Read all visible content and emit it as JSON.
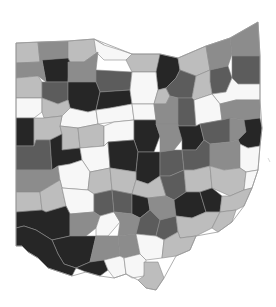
{
  "map": {
    "title": "",
    "region": "Ohio counties",
    "legend": [],
    "shade_palette": {
      "white": "#f7f7f7",
      "light": "#bdbdbd",
      "medium": "#8c8c8c",
      "dark": "#5c5c5c",
      "black": "#262626"
    },
    "counties": [
      {
        "id": "c01",
        "shade": "light",
        "points": "16,43 38,42 40,62 16,63"
      },
      {
        "id": "c02",
        "shade": "medium",
        "points": "38,42 68,41 68,58 42,60 40,62"
      },
      {
        "id": "c03",
        "shade": "light",
        "points": "68,41 94,39 104,45 98,52 84,62 70,62 68,58"
      },
      {
        "id": "c04",
        "shade": "white",
        "points": "94,39 104,45 120,50 132,54 138,58 126,60 104,60 96,52"
      },
      {
        "id": "c05",
        "shade": "light",
        "points": "132,54 160,54 160,72 132,72 126,60"
      },
      {
        "id": "c06",
        "shade": "black",
        "points": "160,54 178,58 180,70 176,78 166,88 158,90 156,72"
      },
      {
        "id": "c07",
        "shade": "light",
        "points": "178,58 206,46 210,70 196,76 180,70"
      },
      {
        "id": "c08",
        "shade": "medium",
        "points": "206,46 230,38 232,54 228,66 210,70"
      },
      {
        "id": "c09",
        "shade": "medium",
        "points": "230,38 258,22 260,56 232,56 232,54"
      },
      {
        "id": "c10",
        "shade": "dark",
        "points": "232,56 260,56 260,84 238,84 232,78"
      },
      {
        "id": "c11",
        "shade": "dark",
        "points": "210,70 228,66 232,78 226,92 212,94 210,82"
      },
      {
        "id": "c12",
        "shade": "black",
        "points": "42,60 68,58 70,62 68,82 46,82"
      },
      {
        "id": "c13",
        "shade": "medium",
        "points": "16,63 40,62 42,60 46,82 38,76 16,78"
      },
      {
        "id": "c14",
        "shade": "medium",
        "points": "68,62 84,62 98,52 96,70 96,82 70,82 68,82"
      },
      {
        "id": "c15",
        "shade": "dark",
        "points": "96,70 132,72 130,90 100,92 96,82"
      },
      {
        "id": "c16",
        "shade": "light",
        "points": "16,78 38,76 42,82 42,98 16,98"
      },
      {
        "id": "c17",
        "shade": "dark",
        "points": "42,82 68,82 68,100 58,104 42,98"
      },
      {
        "id": "c18",
        "shade": "black",
        "points": "68,82 96,82 100,92 96,110 88,112 70,108 68,100"
      },
      {
        "id": "c19",
        "shade": "black",
        "points": "100,92 130,90 132,104 110,108 96,110"
      },
      {
        "id": "c20",
        "shade": "white",
        "points": "132,72 156,72 158,90 154,104 132,104 130,90"
      },
      {
        "id": "c21",
        "shade": "light",
        "points": "158,90 166,88 170,96 166,104 154,104"
      },
      {
        "id": "c22",
        "shade": "dark",
        "points": "166,88 176,78 180,70 196,76 192,98 178,98 170,96"
      },
      {
        "id": "c23",
        "shade": "light",
        "points": "196,76 210,70 210,82 212,94 194,100 192,98"
      },
      {
        "id": "c24",
        "shade": "white",
        "points": "212,94 226,92 232,78 238,84 260,84 260,100 236,100 220,104"
      },
      {
        "id": "c25",
        "shade": "white",
        "points": "16,98 42,98 42,112 34,118 16,118"
      },
      {
        "id": "c26",
        "shade": "light",
        "points": "42,98 58,104 68,100 70,108 62,116 44,118 42,112"
      },
      {
        "id": "c27",
        "shade": "white",
        "points": "70,108 88,112 96,110 98,124 78,128 60,126 62,116"
      },
      {
        "id": "c28",
        "shade": "white",
        "points": "96,110 110,108 132,104 134,120 114,122 98,124"
      },
      {
        "id": "c29",
        "shade": "white",
        "points": "132,104 154,104 156,120 134,120"
      },
      {
        "id": "c30",
        "shade": "medium",
        "points": "154,104 166,104 170,96 178,98 178,124 156,124 156,120"
      },
      {
        "id": "c31",
        "shade": "dark",
        "points": "178,98 192,98 194,100 196,126 178,126 178,124"
      },
      {
        "id": "c32",
        "shade": "white",
        "points": "194,100 212,94 220,104 222,120 200,124 196,126"
      },
      {
        "id": "c33",
        "shade": "medium",
        "points": "220,104 236,100 260,100 260,118 244,120 230,118 222,120"
      },
      {
        "id": "c34",
        "shade": "black",
        "points": "16,118 34,118 34,146 16,146"
      },
      {
        "id": "c35",
        "shade": "light",
        "points": "34,118 44,118 62,116 60,126 62,134 50,140 36,140 34,146 34,118"
      },
      {
        "id": "c36",
        "shade": "light",
        "points": "60,126 78,128 80,148 62,150 62,134"
      },
      {
        "id": "c37",
        "shade": "light",
        "points": "78,128 98,124 104,126 104,146 80,148"
      },
      {
        "id": "c38",
        "shade": "white",
        "points": "104,126 114,122 134,120 134,140 108,142 104,146"
      },
      {
        "id": "c39",
        "shade": "black",
        "points": "134,120 156,120 156,124 160,136 154,152 138,152 134,140"
      },
      {
        "id": "c40",
        "shade": "medium",
        "points": "156,124 178,124 178,126 182,140 174,150 160,152 160,136"
      },
      {
        "id": "c41",
        "shade": "black",
        "points": "178,126 196,126 200,124 204,140 196,150 182,150 182,140"
      },
      {
        "id": "c42",
        "shade": "dark",
        "points": "200,124 222,120 230,118 230,142 210,144 204,140"
      },
      {
        "id": "c43",
        "shade": "medium",
        "points": "230,118 244,120 246,132 238,140 230,142"
      },
      {
        "id": "c44",
        "shade": "black",
        "points": "244,120 260,118 262,128 260,146 248,148 240,144 238,140 246,132"
      },
      {
        "id": "c45",
        "shade": "dark",
        "points": "16,146 34,146 36,140 50,140 52,170 16,170"
      },
      {
        "id": "c46",
        "shade": "black",
        "points": "50,140 62,134 62,150 80,148 82,160 70,164 58,166 52,170"
      },
      {
        "id": "c47",
        "shade": "white",
        "points": "80,148 104,146 108,142 110,168 90,172 82,160"
      },
      {
        "id": "c48",
        "shade": "black",
        "points": "108,142 134,140 138,152 136,172 110,168"
      },
      {
        "id": "c49",
        "shade": "black",
        "points": "138,152 154,152 160,152 160,176 148,184 136,180 136,172"
      },
      {
        "id": "c50",
        "shade": "dark",
        "points": "160,152 174,150 182,150 184,170 170,176 160,176"
      },
      {
        "id": "c51",
        "shade": "dark",
        "points": "182,150 196,150 204,140 210,144 210,166 194,170 184,170"
      },
      {
        "id": "c52",
        "shade": "medium",
        "points": "210,144 230,142 238,140 240,144 240,168 224,170 210,166"
      },
      {
        "id": "c53",
        "shade": "white",
        "points": "240,144 248,148 260,146 258,170 246,172 240,168"
      },
      {
        "id": "c54",
        "shade": "medium",
        "points": "16,170 52,170 58,166 60,180 40,192 16,192"
      },
      {
        "id": "c55",
        "shade": "white",
        "points": "58,166 70,164 82,160 90,172 88,190 62,188 60,180"
      },
      {
        "id": "c56",
        "shade": "light",
        "points": "90,172 110,168 112,190 94,194 88,190"
      },
      {
        "id": "c57",
        "shade": "light",
        "points": "110,168 136,172 136,180 132,194 112,190"
      },
      {
        "id": "c58",
        "shade": "light",
        "points": "136,180 148,184 160,176 166,196 148,198 132,194"
      },
      {
        "id": "c59",
        "shade": "dark",
        "points": "160,176 170,176 184,170 186,192 174,200 166,196"
      },
      {
        "id": "c60",
        "shade": "light",
        "points": "184,170 194,170 210,166 212,188 200,192 186,192"
      },
      {
        "id": "c61",
        "shade": "light",
        "points": "210,166 224,170 240,168 246,172 244,190 230,196 212,188"
      },
      {
        "id": "c62",
        "shade": "white",
        "points": "246,172 258,170 252,188 244,190"
      },
      {
        "id": "c63",
        "shade": "light",
        "points": "16,192 40,192 42,210 16,212"
      },
      {
        "id": "c64",
        "shade": "light",
        "points": "40,192 60,180 62,188 66,206 46,212 42,210"
      },
      {
        "id": "c65",
        "shade": "white",
        "points": "62,188 88,190 94,194 94,212 70,214 66,206"
      },
      {
        "id": "c66",
        "shade": "dark",
        "points": "94,194 112,190 114,212 100,216 94,212"
      },
      {
        "id": "c67",
        "shade": "dark",
        "points": "112,190 132,194 132,214 114,212"
      },
      {
        "id": "c68",
        "shade": "black",
        "points": "132,194 148,198 150,210 140,218 132,214"
      },
      {
        "id": "c69",
        "shade": "medium",
        "points": "148,198 166,196 174,200 176,216 160,220 150,210"
      },
      {
        "id": "c70",
        "shade": "black",
        "points": "174,200 186,192 200,192 206,212 192,218 176,216"
      },
      {
        "id": "c71",
        "shade": "black",
        "points": "200,192 212,188 222,196 220,212 206,212"
      },
      {
        "id": "c72",
        "shade": "light",
        "points": "222,196 230,196 244,190 252,188 244,206 236,210 220,212"
      },
      {
        "id": "c73",
        "shade": "black",
        "points": "16,212 42,210 46,212 66,206 70,214 70,236 52,240 36,230 24,226 16,228"
      },
      {
        "id": "c74",
        "shade": "medium",
        "points": "70,214 94,212 100,216 96,228 86,236 70,236"
      },
      {
        "id": "c75",
        "shade": "white",
        "points": "100,216 114,212 120,222 108,236 96,236 96,228"
      },
      {
        "id": "c76",
        "shade": "medium",
        "points": "114,212 132,214 140,218 136,234 118,236 120,222"
      },
      {
        "id": "c77",
        "shade": "dark",
        "points": "140,218 150,210 160,220 156,236 136,234"
      },
      {
        "id": "c78",
        "shade": "dark",
        "points": "160,220 176,216 178,232 164,240 156,236"
      },
      {
        "id": "c79",
        "shade": "light",
        "points": "176,216 192,218 206,212 220,212 212,228 196,236 180,238 178,232"
      },
      {
        "id": "c80",
        "shade": "light",
        "points": "220,212 236,210 232,222 218,232 212,228"
      },
      {
        "id": "c81",
        "shade": "black",
        "points": "52,240 70,236 86,236 96,236 90,262 76,268 64,264 58,254"
      },
      {
        "id": "c82",
        "shade": "medium",
        "points": "96,236 108,236 118,236 120,256 104,260 90,262"
      },
      {
        "id": "c83",
        "shade": "medium",
        "points": "118,236 136,234 140,254 124,258 120,256"
      },
      {
        "id": "c84",
        "shade": "white",
        "points": "136,234 156,236 164,240 162,258 146,260 140,254"
      },
      {
        "id": "c85",
        "shade": "light",
        "points": "164,240 178,232 180,238 196,236 190,250 176,256 162,258"
      },
      {
        "id": "c86",
        "shade": "black",
        "points": "16,228 24,226 36,230 52,240 58,254 64,264 76,268 72,276 60,272 48,268 38,258 28,252 22,246 16,246"
      },
      {
        "id": "c87",
        "shade": "black",
        "points": "76,268 90,262 104,260 108,270 100,276 86,272"
      },
      {
        "id": "c88",
        "shade": "white",
        "points": "104,260 120,256 124,258 126,274 114,278 108,270"
      },
      {
        "id": "c89",
        "shade": "white",
        "points": "124,258 140,254 146,260 144,276 132,278 126,274"
      },
      {
        "id": "c90",
        "shade": "light",
        "points": "144,262 158,262 164,278 156,290 146,288 138,280 144,276"
      }
    ],
    "state_outline": "16,43 68,41 94,39 132,54 160,54 178,58 206,46 230,38 258,22 260,56 260,100 262,128 260,146 258,170 252,188 244,206 232,222 218,232 196,236 190,250 176,256 164,278 156,290 146,288 138,280 126,274 114,278 100,276 86,272 72,276 60,272 48,268 38,258 28,252 22,246 16,246"
  },
  "annotations": {
    "stray_tick_mark": {
      "x1": 268,
      "y1": 158,
      "x2": 270,
      "y2": 162
    }
  }
}
